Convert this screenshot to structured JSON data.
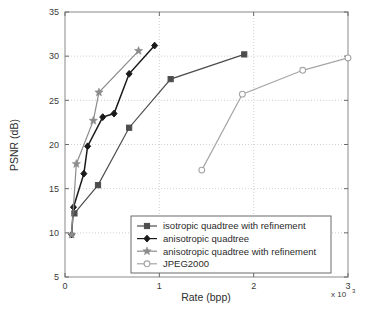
{
  "chart_data": {
    "type": "line",
    "title": "",
    "xlabel": "Rate (bpp)",
    "ylabel": "PSNR (dB)",
    "x_exponent": "x 10",
    "x_exponent_power": "3",
    "xlim": [
      0,
      3
    ],
    "ylim": [
      5,
      35
    ],
    "xticks": [
      "0",
      "1",
      "2",
      "3"
    ],
    "xtick_values": [
      0,
      1,
      2,
      3
    ],
    "yticks": [
      "5",
      "10",
      "15",
      "20",
      "25",
      "30",
      "35"
    ],
    "ytick_values": [
      5,
      10,
      15,
      20,
      25,
      30,
      35
    ],
    "grid": "dotted",
    "legend_position": "lower right",
    "series": [
      {
        "name": "isotropic quadtree with refinement",
        "marker": "square",
        "color": "#4d4d4d",
        "x": [
          0.1,
          0.35,
          0.68,
          1.12,
          1.9
        ],
        "y": [
          12.2,
          15.4,
          21.9,
          27.4,
          30.2
        ]
      },
      {
        "name": "anisotropic quadtree",
        "marker": "diamond",
        "color": "#1a1a1a",
        "x": [
          0.07,
          0.09,
          0.2,
          0.24,
          0.4,
          0.52,
          0.68,
          0.95
        ],
        "y": [
          9.8,
          12.9,
          16.7,
          19.8,
          23.1,
          23.5,
          28.0,
          31.2
        ]
      },
      {
        "name": "anisotropic quadtree with refinement",
        "marker": "star",
        "color": "#8c8c8c",
        "x": [
          0.07,
          0.12,
          0.3,
          0.36,
          0.78
        ],
        "y": [
          9.8,
          17.8,
          22.7,
          25.9,
          30.6
        ]
      },
      {
        "name": "JPEG2000",
        "marker": "circle",
        "color": "#a6a6a6",
        "x": [
          1.45,
          1.88,
          2.52,
          3.0
        ],
        "y": [
          17.1,
          25.7,
          28.4,
          29.8
        ]
      }
    ]
  },
  "legend": {
    "items": [
      {
        "label": "isotropic quadtree with refinement"
      },
      {
        "label": "anisotropic quadtree"
      },
      {
        "label": "anisotropic quadtree with refinement"
      },
      {
        "label": "JPEG2000"
      }
    ]
  }
}
